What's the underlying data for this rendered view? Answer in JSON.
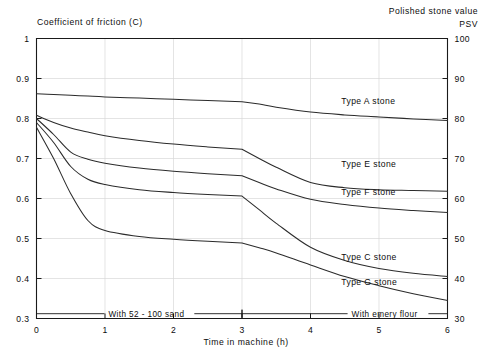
{
  "chart_data": {
    "type": "line",
    "title": "Coefficient of friction (C)",
    "right_title_line1": "Polished stone value",
    "right_title_line2": "PSV",
    "xlabel": "Time in machine (h)",
    "ylabel": "Coefficient of friction (C)",
    "ylabel_right": "Polished stone value PSV",
    "xlim": [
      0,
      6
    ],
    "ylim": [
      0.3,
      1.0
    ],
    "xticks": [
      "0",
      "1",
      "2",
      "3",
      "4",
      "5",
      "6"
    ],
    "xtick_values": [
      0,
      1,
      2,
      3,
      4,
      5,
      6
    ],
    "yticks": [
      "0.3",
      "0.4",
      "0.5",
      "0.6",
      "0.7",
      "0.8",
      "0.9",
      "1"
    ],
    "ytick_values": [
      0.3,
      0.4,
      0.5,
      0.6,
      0.7,
      0.8,
      0.9,
      1.0
    ],
    "yticks_right": [
      "30",
      "40",
      "50",
      "60",
      "70",
      "80",
      "90",
      "100"
    ],
    "ytick_right_values": [
      30,
      40,
      50,
      60,
      70,
      80,
      90,
      100
    ],
    "grid": true,
    "legend_position": "inline-right",
    "line_color": "#2b2b2b",
    "x": [
      0,
      0.25,
      0.5,
      0.75,
      1,
      1.5,
      2,
      2.5,
      3,
      3.25,
      3.5,
      4,
      4.5,
      5,
      5.5,
      6
    ],
    "series": [
      {
        "name": "Type A stone",
        "label": "Type A stone",
        "values": [
          0.862,
          0.86,
          0.858,
          0.856,
          0.854,
          0.851,
          0.848,
          0.845,
          0.842,
          0.836,
          0.828,
          0.816,
          0.809,
          0.804,
          0.799,
          0.795
        ],
        "label_x": 4.45,
        "label_y": 0.845
      },
      {
        "name": "Type E stone",
        "label": "Type E stone",
        "values": [
          0.808,
          0.79,
          0.776,
          0.766,
          0.757,
          0.745,
          0.736,
          0.729,
          0.723,
          0.7,
          0.678,
          0.64,
          0.627,
          0.622,
          0.62,
          0.618
        ],
        "label_x": 4.45,
        "label_y": 0.688
      },
      {
        "name": "Type F stone",
        "label": "Type F stone",
        "values": [
          0.8,
          0.76,
          0.716,
          0.698,
          0.688,
          0.676,
          0.668,
          0.662,
          0.657,
          0.64,
          0.624,
          0.598,
          0.585,
          0.576,
          0.57,
          0.565
        ],
        "label_x": 4.45,
        "label_y": 0.618
      },
      {
        "name": "Type C stone",
        "label": "Type C stone",
        "values": [
          0.79,
          0.74,
          0.68,
          0.648,
          0.635,
          0.622,
          0.615,
          0.61,
          0.606,
          0.572,
          0.538,
          0.478,
          0.445,
          0.425,
          0.413,
          0.405
        ],
        "label_x": 4.45,
        "label_y": 0.455
      },
      {
        "name": "Type G stone",
        "label": "Type G stone",
        "values": [
          0.778,
          0.7,
          0.612,
          0.545,
          0.52,
          0.505,
          0.498,
          0.493,
          0.489,
          0.477,
          0.464,
          0.434,
          0.405,
          0.382,
          0.362,
          0.345
        ],
        "label_x": 4.45,
        "label_y": 0.393
      }
    ],
    "annotations": [
      {
        "text": "With 52 - 100 sand",
        "x_start": 0,
        "x_end": 3,
        "y": 0.312,
        "text_x": 1.05
      },
      {
        "text": "With emery flour",
        "x_start": 3,
        "x_end": 6,
        "y": 0.312,
        "text_x": 4.6
      }
    ]
  }
}
